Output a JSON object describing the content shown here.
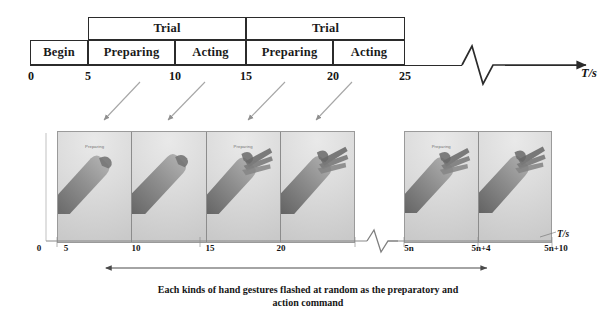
{
  "figure": {
    "axis_unit": "T/s"
  },
  "timeline": {
    "trial_label": "Trial",
    "trials": [
      {
        "label": "Trial",
        "start": 5,
        "end": 15
      },
      {
        "label": "Trial",
        "start": 15,
        "end": 25
      }
    ],
    "phases": [
      {
        "label": "Begin",
        "start": 0,
        "end": 5
      },
      {
        "label": "Preparing",
        "start": 5,
        "end": 10
      },
      {
        "label": "Acting",
        "start": 10,
        "end": 15
      },
      {
        "label": "Preparing",
        "start": 15,
        "end": 20
      },
      {
        "label": "Acting",
        "start": 20,
        "end": 25
      }
    ],
    "ticks": [
      "0",
      "5",
      "10",
      "15",
      "20",
      "25"
    ],
    "tick_values": [
      0,
      5,
      10,
      15,
      20,
      25
    ],
    "break_symbol": "axis-break-zigzag"
  },
  "panel": {
    "photo_label": "Preparing",
    "frames": [
      {
        "time": "5",
        "gesture": "fist-pointing-down-left"
      },
      {
        "time": "10",
        "gesture": "fist-pointing-down-left"
      },
      {
        "time": "15",
        "gesture": "open-hand-fingers-spread"
      },
      {
        "time": "20",
        "gesture": "open-hand-fingers-spread"
      },
      {
        "time": "5n",
        "gesture": "open-hand-fingers-spread"
      },
      {
        "time": "5n+4",
        "gesture": "open-hand-fingers-spread"
      }
    ],
    "left_ticks": [
      "0",
      "5",
      "10",
      "15",
      "20"
    ],
    "right_ticks": [
      "5n",
      "5n+4",
      "5n+10"
    ],
    "axis_unit": "T/s",
    "break_symbol": "axis-break-zigzag"
  },
  "caption": {
    "line1": "Each kinds of hand gestures flashed at random as the preparatory and",
    "line2": "action command"
  },
  "colors": {
    "ink": "#1a1a1a",
    "box_border": "#2b2b2b",
    "panel_border": "#9a9a9a",
    "photo_bg": "#d8d8d8",
    "arrow": "#8f8f8f"
  },
  "arrows": {
    "cue_arrows_count": 4,
    "span_arrow_label": "panel-span-double-arrow"
  }
}
